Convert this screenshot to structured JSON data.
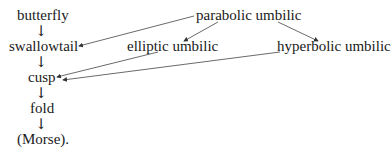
{
  "diagram": {
    "nodes": {
      "butterfly": "butterfly",
      "swallowtail": "swallowtail",
      "cusp": "cusp",
      "fold": "fold",
      "morse": "(Morse).",
      "parabolic_umbilic": "parabolic umbilic",
      "elliptic_umbilic": "elliptic umbilic",
      "hyperbolic_umbilic": "hyperbolic umbilic"
    },
    "down_arrow": "↓",
    "edges": [
      {
        "from": "butterfly",
        "to": "swallowtail"
      },
      {
        "from": "swallowtail",
        "to": "cusp"
      },
      {
        "from": "cusp",
        "to": "fold"
      },
      {
        "from": "fold",
        "to": "morse"
      },
      {
        "from": "parabolic_umbilic",
        "to": "swallowtail"
      },
      {
        "from": "parabolic_umbilic",
        "to": "elliptic_umbilic"
      },
      {
        "from": "parabolic_umbilic",
        "to": "hyperbolic_umbilic"
      },
      {
        "from": "elliptic_umbilic",
        "to": "cusp"
      },
      {
        "from": "hyperbolic_umbilic",
        "to": "cusp"
      }
    ]
  }
}
